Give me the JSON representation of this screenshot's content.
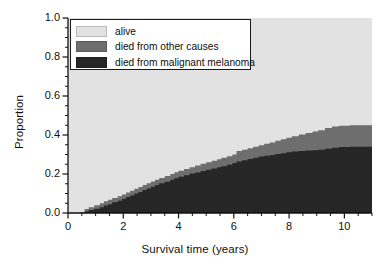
{
  "chart_data": {
    "type": "area",
    "title": "",
    "subtitle": "",
    "xlabel": "Survival time (years)",
    "ylabel": "Proportion",
    "xlim": [
      0,
      11
    ],
    "ylim": [
      0,
      1
    ],
    "xticks": [
      0,
      2,
      4,
      6,
      8,
      10
    ],
    "xtick_labels": [
      "0",
      "2",
      "4",
      "6",
      "8",
      "10"
    ],
    "xminor_step": 0.5,
    "yticks": [
      0.0,
      0.2,
      0.4,
      0.6,
      0.8,
      1.0
    ],
    "ytick_labels": [
      "0.0",
      "0.2",
      "0.4",
      "0.6",
      "0.8",
      "1.0"
    ],
    "yminor_step": 0.05,
    "grid": false,
    "stacked": true,
    "legend_position": "top-left-inside",
    "legend": [
      "alive",
      "died from other causes",
      "died from malignant melanoma"
    ],
    "colors": {
      "alive": "#e2e2e2",
      "died_other": "#6e6e6e",
      "died_melanoma": "#262626",
      "axis": "#111111",
      "legend_background": "#ffffff",
      "legend_border": "#1a1a1a",
      "figure_background": "#ffffff"
    },
    "series": [
      {
        "name": "died from malignant melanoma",
        "color": "#262626",
        "step": "post",
        "description": "cumulative incidence of death from malignant melanoma",
        "x": [
          0,
          0.45,
          0.6,
          0.75,
          0.95,
          1.15,
          1.3,
          1.45,
          1.6,
          1.8,
          1.95,
          2.1,
          2.25,
          2.4,
          2.55,
          2.7,
          2.85,
          3.0,
          3.15,
          3.3,
          3.5,
          3.7,
          3.85,
          4.0,
          4.2,
          4.4,
          4.6,
          4.8,
          5.0,
          5.2,
          5.4,
          5.55,
          5.75,
          5.95,
          6.1,
          6.3,
          6.5,
          6.7,
          6.9,
          7.1,
          7.3,
          7.5,
          7.7,
          7.9,
          8.1,
          8.35,
          8.6,
          8.85,
          9.05,
          9.3,
          9.55,
          9.8,
          10.2,
          11.0
        ],
        "y": [
          0.0,
          0.0,
          0.008,
          0.015,
          0.022,
          0.03,
          0.038,
          0.045,
          0.055,
          0.063,
          0.072,
          0.082,
          0.09,
          0.1,
          0.108,
          0.118,
          0.126,
          0.134,
          0.143,
          0.152,
          0.16,
          0.17,
          0.178,
          0.186,
          0.194,
          0.202,
          0.208,
          0.215,
          0.222,
          0.228,
          0.234,
          0.24,
          0.248,
          0.256,
          0.264,
          0.27,
          0.277,
          0.283,
          0.29,
          0.294,
          0.298,
          0.302,
          0.307,
          0.311,
          0.315,
          0.318,
          0.32,
          0.322,
          0.325,
          0.33,
          0.335,
          0.338,
          0.34,
          0.34
        ]
      },
      {
        "name": "died from other causes",
        "color": "#6e6e6e",
        "step": "post",
        "description": "cumulative incidence of death from malignant melanoma plus death from other causes (upper edge of stacked band)",
        "x": [
          0,
          0.45,
          0.6,
          0.75,
          0.95,
          1.15,
          1.3,
          1.45,
          1.6,
          1.8,
          1.95,
          2.1,
          2.25,
          2.4,
          2.55,
          2.7,
          2.85,
          3.0,
          3.15,
          3.3,
          3.5,
          3.7,
          3.85,
          4.0,
          4.2,
          4.4,
          4.6,
          4.8,
          5.0,
          5.2,
          5.4,
          5.55,
          5.75,
          5.95,
          6.1,
          6.3,
          6.5,
          6.7,
          6.9,
          7.1,
          7.3,
          7.5,
          7.7,
          7.9,
          8.1,
          8.35,
          8.6,
          8.85,
          9.05,
          9.3,
          9.55,
          9.8,
          10.2,
          11.0
        ],
        "y": [
          0.0,
          0.005,
          0.02,
          0.03,
          0.04,
          0.05,
          0.06,
          0.068,
          0.077,
          0.086,
          0.095,
          0.105,
          0.114,
          0.124,
          0.133,
          0.143,
          0.152,
          0.162,
          0.17,
          0.18,
          0.19,
          0.2,
          0.209,
          0.217,
          0.226,
          0.235,
          0.243,
          0.252,
          0.26,
          0.268,
          0.276,
          0.283,
          0.291,
          0.3,
          0.318,
          0.325,
          0.332,
          0.34,
          0.348,
          0.355,
          0.362,
          0.37,
          0.378,
          0.386,
          0.394,
          0.402,
          0.41,
          0.418,
          0.425,
          0.436,
          0.444,
          0.448,
          0.45,
          0.45
        ]
      },
      {
        "name": "alive",
        "color": "#e2e2e2",
        "description": "remaining proportion alive (fills area above the stacked death bands up to 1.0)",
        "final_value": 0.55
      }
    ],
    "annotations": {
      "final_melanoma_deaths": 0.34,
      "final_other_deaths": 0.11,
      "final_alive": 0.55,
      "first_event_time": 0.45
    }
  }
}
